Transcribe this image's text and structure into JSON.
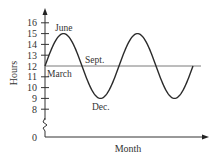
{
  "chart_data": {
    "type": "line",
    "title": "",
    "xlabel": "Month",
    "ylabel": "Hours",
    "y_ticks": [
      0,
      8,
      9,
      10,
      11,
      12,
      13,
      14,
      15,
      16
    ],
    "y_tick_labels": [
      "0",
      "8",
      "9",
      "10",
      "11",
      "12",
      "13",
      "14",
      "15",
      "16"
    ],
    "ylim": [
      0,
      16
    ],
    "y_axis_break": true,
    "reference_line": 12,
    "series": [
      {
        "name": "Daylight hours",
        "description": "Sinusoid centered at 12 with amplitude 3 (max 15, min 9), two full periods",
        "x": [
          "March",
          "June",
          "Sept.",
          "Dec.",
          "March",
          "June",
          "Sept.",
          "Dec.",
          "March"
        ],
        "values": [
          12,
          15,
          12,
          9,
          12,
          15,
          12,
          9,
          12
        ]
      }
    ],
    "annotations": [
      {
        "text": "June",
        "at": "first maximum (15)"
      },
      {
        "text": "March",
        "at": "start (12)"
      },
      {
        "text": "Sept.",
        "at": "first downward crossing of 12"
      },
      {
        "text": "Dec.",
        "at": "first minimum (9)"
      }
    ],
    "grid": false,
    "legend": null
  },
  "labels": {
    "y_axis_title": "Hours",
    "x_axis_title": "Month",
    "june": "June",
    "march": "March",
    "sept": "Sept.",
    "dec": "Dec."
  },
  "colors": {
    "curve": "#2b2b2b",
    "axis": "#333333",
    "reference_line": "#7a7a7a",
    "text": "#333333"
  }
}
